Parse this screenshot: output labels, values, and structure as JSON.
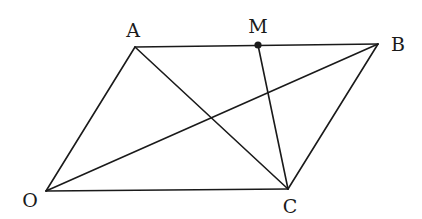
{
  "diagram": {
    "type": "geometry",
    "points": {
      "O": {
        "label": "O",
        "x": 46,
        "y": 191,
        "lx": 30,
        "ly": 207
      },
      "A": {
        "label": "A",
        "x": 135,
        "y": 47,
        "lx": 133,
        "ly": 37
      },
      "B": {
        "label": "B",
        "x": 378,
        "y": 44,
        "lx": 398,
        "ly": 51
      },
      "C": {
        "label": "C",
        "x": 288,
        "y": 189,
        "lx": 290,
        "ly": 213
      },
      "M": {
        "label": "M",
        "x": 258,
        "y": 45,
        "lx": 258,
        "ly": 33
      }
    },
    "segments": [
      [
        "O",
        "A"
      ],
      [
        "A",
        "B"
      ],
      [
        "B",
        "C"
      ],
      [
        "C",
        "O"
      ],
      [
        "O",
        "B"
      ],
      [
        "A",
        "C"
      ],
      [
        "M",
        "C"
      ]
    ],
    "marked_points": [
      "M"
    ],
    "stroke_color": "#1a1a1a"
  }
}
